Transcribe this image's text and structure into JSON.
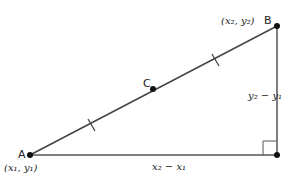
{
  "diagram": {
    "points": {
      "A": {
        "label": "A",
        "coord_label": "(x₁, y₁)",
        "x": 30,
        "y": 155
      },
      "B": {
        "label": "B",
        "coord_label": "(x₂, y₂)",
        "x": 277,
        "y": 26
      },
      "C": {
        "label": "C",
        "x": 153,
        "y": 89
      },
      "corner": {
        "x": 277,
        "y": 155
      }
    },
    "segments": {
      "horizontal_label": "x₂ − x₁",
      "vertical_label": "y₂ − y₁"
    },
    "colors": {
      "line": "#444444",
      "point": "#111111"
    }
  }
}
